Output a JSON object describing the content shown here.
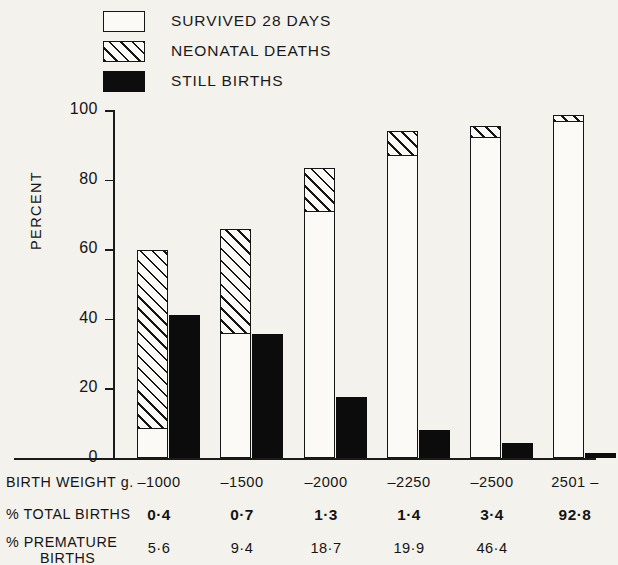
{
  "legend": {
    "items": [
      {
        "key": "survived",
        "label": "SURVIVED  28 DAYS",
        "swatch": "white-outline"
      },
      {
        "key": "neonatal",
        "label": "NEONATAL  DEATHS",
        "swatch": "hatched"
      },
      {
        "key": "stillborn",
        "label": "STILL BIRTHS",
        "swatch": "solid-black"
      }
    ]
  },
  "axis": {
    "y_title": "PERCENT",
    "y_ticks": [
      "100",
      "80",
      "60",
      "40",
      "20",
      "0"
    ],
    "y_tick_values": [
      100,
      80,
      60,
      40,
      20,
      0
    ]
  },
  "table": {
    "rows": [
      {
        "key": "birth_weight",
        "header": "BIRTH WEIGHT  g.",
        "header_sub": "",
        "bold": false,
        "values": [
          "–1000",
          "–1500",
          "–2000",
          "–2250",
          "–2500",
          "2501 –"
        ]
      },
      {
        "key": "percent_total_births",
        "header": "% TOTAL BIRTHS",
        "header_sub": "",
        "bold": true,
        "values": [
          "0·4",
          "0·7",
          "1·3",
          "1·4",
          "3·4",
          "92·8"
        ]
      },
      {
        "key": "percent_premature_births",
        "header": "% PREMATURE",
        "header_sub": "BIRTHS",
        "bold": false,
        "values": [
          "5·6",
          "9·4",
          "18·7",
          "19·9",
          "46·4",
          ""
        ]
      }
    ]
  },
  "colors": {
    "background": "#f4f2ec",
    "ink": "#161616",
    "bar_fill": "#fbfaf6",
    "solid_black": "#0c0c0c"
  },
  "chart_data": {
    "type": "bar",
    "title": "",
    "subtitle": "",
    "xlabel": "BIRTH WEIGHT  g.",
    "ylabel": "PERCENT",
    "ylim": [
      0,
      100
    ],
    "grid": false,
    "legend_position": "top-left",
    "stacking": "stacked-plus-adjacent",
    "categories": [
      "–1000",
      "–1500",
      "–2000",
      "–2250",
      "–2500",
      "2501 –"
    ],
    "series": [
      {
        "name": "SURVIVED  28 DAYS",
        "style": "white-outline",
        "stack": "outcome",
        "values": [
          8.6,
          35.9,
          71.0,
          87.0,
          92.2,
          96.8
        ]
      },
      {
        "name": "NEONATAL  DEATHS",
        "style": "hatched",
        "stack": "outcome",
        "values": [
          51.2,
          29.9,
          12.3,
          7.0,
          3.2,
          1.8
        ]
      },
      {
        "name": "STILL BIRTHS",
        "style": "solid-black",
        "stack": "separate",
        "values": [
          41.0,
          35.6,
          17.5,
          8.0,
          4.3,
          1.4
        ]
      }
    ],
    "stack_totals": [
      59.8,
      65.8,
      83.3,
      94.0,
      95.4,
      98.6
    ],
    "annotations": {
      "% TOTAL BIRTHS": [
        "0·4",
        "0·7",
        "1·3",
        "1·4",
        "3·4",
        "92·8"
      ],
      "% PREMATURE BIRTHS": [
        "5·6",
        "9·4",
        "18·7",
        "19·9",
        "46·4",
        ""
      ]
    }
  },
  "geometry": {
    "group_x": [
      137,
      220,
      304,
      387,
      470,
      553
    ],
    "bar_width": 31,
    "baseline_y": 358,
    "pixels_per_percent": 3.48
  }
}
